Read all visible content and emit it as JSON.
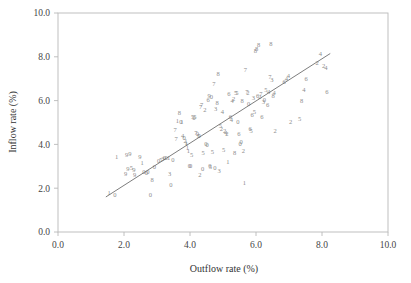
{
  "chart_data": {
    "type": "scatter",
    "title": "",
    "subtitle": "",
    "xlabel": "Outflow rate (%)",
    "ylabel": "Inflow rate (%)",
    "xlim": [
      0.0,
      10.0
    ],
    "ylim": [
      0.0,
      10.0
    ],
    "xticks": [
      0.0,
      2.0,
      4.0,
      6.0,
      8.0,
      10.0
    ],
    "yticks": [
      0.0,
      2.0,
      4.0,
      6.0,
      8.0,
      10.0
    ],
    "xtick_labels": [
      "0.0",
      "2.0",
      "4.0",
      "6.0",
      "8.0",
      "10.0"
    ],
    "ytick_labels": [
      "0.0",
      "2.0",
      "4.0",
      "6.0",
      "8.0",
      "10.0"
    ],
    "grid": false,
    "legend": "none",
    "marker_style": "digit-glyph",
    "marker_note": "Each plotted point is drawn as a single digit character (0-9) encoding a group code rather than a symbol marker.",
    "point_color": "#8c8c8c",
    "axis_color": "#b9b9b9",
    "fit_line": {
      "type": "linear-regression",
      "color": "#6e6e6e",
      "x_start": 1.45,
      "y_start": 1.6,
      "x_end": 8.25,
      "y_end": 8.15,
      "slope": 0.963,
      "intercept": 0.203
    },
    "points": [
      {
        "x": 1.55,
        "y": 1.8,
        "label": "1"
      },
      {
        "x": 1.72,
        "y": 1.7,
        "label": "0"
      },
      {
        "x": 1.78,
        "y": 3.45,
        "label": "1"
      },
      {
        "x": 2.08,
        "y": 3.52,
        "label": "9"
      },
      {
        "x": 2.18,
        "y": 3.58,
        "label": "9"
      },
      {
        "x": 2.12,
        "y": 2.88,
        "label": "9"
      },
      {
        "x": 2.22,
        "y": 2.92,
        "label": "5"
      },
      {
        "x": 2.3,
        "y": 2.85,
        "label": "9"
      },
      {
        "x": 2.05,
        "y": 2.68,
        "label": "9"
      },
      {
        "x": 2.48,
        "y": 3.45,
        "label": "9"
      },
      {
        "x": 2.32,
        "y": 2.6,
        "label": "9"
      },
      {
        "x": 2.55,
        "y": 3.18,
        "label": "1"
      },
      {
        "x": 2.6,
        "y": 2.78,
        "label": "0"
      },
      {
        "x": 2.68,
        "y": 2.72,
        "label": "0"
      },
      {
        "x": 2.72,
        "y": 2.75,
        "label": "0"
      },
      {
        "x": 2.8,
        "y": 1.72,
        "label": "0"
      },
      {
        "x": 2.85,
        "y": 2.4,
        "label": "8"
      },
      {
        "x": 2.92,
        "y": 2.98,
        "label": "0"
      },
      {
        "x": 3.05,
        "y": 3.28,
        "label": "0"
      },
      {
        "x": 3.12,
        "y": 3.3,
        "label": "5"
      },
      {
        "x": 3.18,
        "y": 3.35,
        "label": "3"
      },
      {
        "x": 3.22,
        "y": 3.4,
        "label": "0"
      },
      {
        "x": 3.28,
        "y": 3.38,
        "label": "0"
      },
      {
        "x": 3.35,
        "y": 3.42,
        "label": "1"
      },
      {
        "x": 3.38,
        "y": 2.65,
        "label": "3"
      },
      {
        "x": 3.42,
        "y": 2.18,
        "label": "0"
      },
      {
        "x": 3.48,
        "y": 3.3,
        "label": "0"
      },
      {
        "x": 3.55,
        "y": 4.68,
        "label": "7"
      },
      {
        "x": 3.58,
        "y": 4.28,
        "label": "7"
      },
      {
        "x": 3.62,
        "y": 5.08,
        "label": "1"
      },
      {
        "x": 3.68,
        "y": 5.45,
        "label": "8"
      },
      {
        "x": 3.72,
        "y": 5.02,
        "label": "0"
      },
      {
        "x": 3.75,
        "y": 5.05,
        "label": "1"
      },
      {
        "x": 3.78,
        "y": 4.42,
        "label": "4"
      },
      {
        "x": 3.82,
        "y": 4.3,
        "label": "0"
      },
      {
        "x": 3.85,
        "y": 4.18,
        "label": "2"
      },
      {
        "x": 3.88,
        "y": 4.1,
        "label": "1"
      },
      {
        "x": 3.9,
        "y": 4.02,
        "label": "1"
      },
      {
        "x": 3.92,
        "y": 3.85,
        "label": "1"
      },
      {
        "x": 3.95,
        "y": 3.72,
        "label": "1"
      },
      {
        "x": 3.98,
        "y": 3.05,
        "label": "0"
      },
      {
        "x": 4.02,
        "y": 3.02,
        "label": "0"
      },
      {
        "x": 4.05,
        "y": 3.55,
        "label": "5"
      },
      {
        "x": 4.08,
        "y": 5.25,
        "label": "5"
      },
      {
        "x": 4.12,
        "y": 5.22,
        "label": "0"
      },
      {
        "x": 4.15,
        "y": 5.28,
        "label": "5"
      },
      {
        "x": 4.18,
        "y": 4.55,
        "label": "7"
      },
      {
        "x": 4.22,
        "y": 4.48,
        "label": "0"
      },
      {
        "x": 4.25,
        "y": 4.42,
        "label": "5"
      },
      {
        "x": 4.28,
        "y": 4.38,
        "label": "0"
      },
      {
        "x": 4.3,
        "y": 2.62,
        "label": "2"
      },
      {
        "x": 4.32,
        "y": 5.72,
        "label": "7"
      },
      {
        "x": 4.35,
        "y": 5.8,
        "label": "7"
      },
      {
        "x": 4.38,
        "y": 2.88,
        "label": "0"
      },
      {
        "x": 4.4,
        "y": 3.62,
        "label": "5"
      },
      {
        "x": 4.45,
        "y": 5.58,
        "label": "2"
      },
      {
        "x": 4.48,
        "y": 4.05,
        "label": "0"
      },
      {
        "x": 4.52,
        "y": 4.0,
        "label": "0"
      },
      {
        "x": 4.55,
        "y": 6.05,
        "label": "6"
      },
      {
        "x": 4.58,
        "y": 6.25,
        "label": "9"
      },
      {
        "x": 4.6,
        "y": 3.02,
        "label": "0"
      },
      {
        "x": 4.62,
        "y": 3.0,
        "label": "5"
      },
      {
        "x": 4.65,
        "y": 6.18,
        "label": "0"
      },
      {
        "x": 4.68,
        "y": 3.65,
        "label": "5"
      },
      {
        "x": 4.72,
        "y": 6.78,
        "label": "7"
      },
      {
        "x": 4.75,
        "y": 2.92,
        "label": "0"
      },
      {
        "x": 4.78,
        "y": 5.62,
        "label": "3"
      },
      {
        "x": 4.82,
        "y": 5.92,
        "label": "8"
      },
      {
        "x": 4.85,
        "y": 7.25,
        "label": "8"
      },
      {
        "x": 4.88,
        "y": 2.82,
        "label": "3"
      },
      {
        "x": 4.92,
        "y": 4.85,
        "label": "5"
      },
      {
        "x": 4.95,
        "y": 4.72,
        "label": "2"
      },
      {
        "x": 4.98,
        "y": 5.52,
        "label": "4"
      },
      {
        "x": 5.02,
        "y": 3.75,
        "label": "5"
      },
      {
        "x": 5.05,
        "y": 4.62,
        "label": "2"
      },
      {
        "x": 5.08,
        "y": 4.55,
        "label": "4"
      },
      {
        "x": 5.12,
        "y": 4.5,
        "label": "2"
      },
      {
        "x": 5.15,
        "y": 3.22,
        "label": "1"
      },
      {
        "x": 5.18,
        "y": 6.3,
        "label": "6"
      },
      {
        "x": 5.22,
        "y": 5.28,
        "label": "6"
      },
      {
        "x": 5.25,
        "y": 5.15,
        "label": "4"
      },
      {
        "x": 5.28,
        "y": 5.98,
        "label": "4"
      },
      {
        "x": 5.32,
        "y": 6.1,
        "label": "2"
      },
      {
        "x": 5.35,
        "y": 3.62,
        "label": "8"
      },
      {
        "x": 5.38,
        "y": 6.35,
        "label": "5"
      },
      {
        "x": 5.42,
        "y": 6.38,
        "label": "5"
      },
      {
        "x": 5.45,
        "y": 5.02,
        "label": "0"
      },
      {
        "x": 5.48,
        "y": 4.48,
        "label": "6"
      },
      {
        "x": 5.52,
        "y": 4.05,
        "label": "0"
      },
      {
        "x": 5.55,
        "y": 4.15,
        "label": "0"
      },
      {
        "x": 5.58,
        "y": 6.02,
        "label": "8"
      },
      {
        "x": 5.62,
        "y": 3.7,
        "label": "2"
      },
      {
        "x": 5.65,
        "y": 2.25,
        "label": "1"
      },
      {
        "x": 5.68,
        "y": 7.42,
        "label": "7"
      },
      {
        "x": 5.72,
        "y": 6.4,
        "label": "7"
      },
      {
        "x": 5.75,
        "y": 6.35,
        "label": "2"
      },
      {
        "x": 5.78,
        "y": 5.88,
        "label": "0"
      },
      {
        "x": 5.82,
        "y": 4.72,
        "label": "6"
      },
      {
        "x": 5.85,
        "y": 4.65,
        "label": "5"
      },
      {
        "x": 5.88,
        "y": 5.35,
        "label": "6"
      },
      {
        "x": 5.92,
        "y": 6.12,
        "label": "3"
      },
      {
        "x": 5.95,
        "y": 5.48,
        "label": "5"
      },
      {
        "x": 5.98,
        "y": 8.28,
        "label": "8"
      },
      {
        "x": 6.02,
        "y": 8.38,
        "label": "8"
      },
      {
        "x": 6.05,
        "y": 6.22,
        "label": "6"
      },
      {
        "x": 6.08,
        "y": 8.55,
        "label": "8"
      },
      {
        "x": 6.12,
        "y": 6.18,
        "label": "2"
      },
      {
        "x": 6.15,
        "y": 6.3,
        "label": "7"
      },
      {
        "x": 6.18,
        "y": 5.25,
        "label": "6"
      },
      {
        "x": 6.22,
        "y": 5.95,
        "label": "3"
      },
      {
        "x": 6.25,
        "y": 6.05,
        "label": "0"
      },
      {
        "x": 6.3,
        "y": 6.48,
        "label": "5"
      },
      {
        "x": 6.35,
        "y": 5.82,
        "label": "6"
      },
      {
        "x": 6.38,
        "y": 6.42,
        "label": "4"
      },
      {
        "x": 6.42,
        "y": 7.08,
        "label": "7"
      },
      {
        "x": 6.45,
        "y": 8.62,
        "label": "8"
      },
      {
        "x": 6.48,
        "y": 6.95,
        "label": "3"
      },
      {
        "x": 6.52,
        "y": 6.25,
        "label": "8"
      },
      {
        "x": 6.55,
        "y": 6.38,
        "label": "4"
      },
      {
        "x": 6.58,
        "y": 4.62,
        "label": "2"
      },
      {
        "x": 6.85,
        "y": 6.88,
        "label": "6"
      },
      {
        "x": 6.92,
        "y": 7.02,
        "label": "4"
      },
      {
        "x": 6.98,
        "y": 7.12,
        "label": "4"
      },
      {
        "x": 7.05,
        "y": 5.02,
        "label": "2"
      },
      {
        "x": 7.32,
        "y": 5.18,
        "label": "5"
      },
      {
        "x": 7.38,
        "y": 6.02,
        "label": "8"
      },
      {
        "x": 7.45,
        "y": 6.48,
        "label": "4"
      },
      {
        "x": 7.52,
        "y": 7.02,
        "label": "6"
      },
      {
        "x": 7.85,
        "y": 7.72,
        "label": "2"
      },
      {
        "x": 7.95,
        "y": 8.15,
        "label": "4"
      },
      {
        "x": 8.05,
        "y": 7.58,
        "label": "2"
      },
      {
        "x": 8.12,
        "y": 7.52,
        "label": "4"
      },
      {
        "x": 8.15,
        "y": 6.42,
        "label": "6"
      }
    ]
  }
}
